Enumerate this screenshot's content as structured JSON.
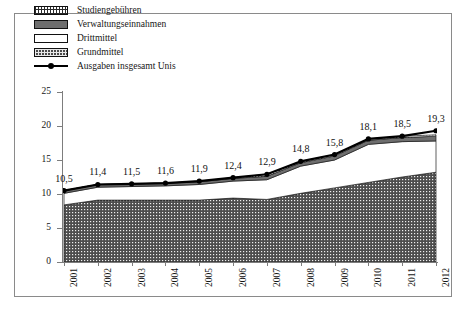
{
  "chart_data": {
    "type": "area",
    "title": "",
    "subtitle": "",
    "xlabel": "",
    "ylabel": "",
    "grid": false,
    "legend_position": "top-left",
    "ylim": [
      0,
      25
    ],
    "yticks": [
      0,
      5,
      10,
      15,
      20,
      25
    ],
    "ytick_labels": [
      "0",
      "5",
      "10",
      "15",
      "20",
      "25"
    ],
    "categories": [
      "2001",
      "2002",
      "2003",
      "2004",
      "2005",
      "2006",
      "2007",
      "2008",
      "2009",
      "2010",
      "2011",
      "2012"
    ],
    "stacked": true,
    "series": [
      {
        "name": "Grundmittel",
        "fill": "dotted-dark",
        "values": [
          8.4,
          9.1,
          9.1,
          9.1,
          9.1,
          9.4,
          9.2,
          10.1,
          10.9,
          11.7,
          12.5,
          13.2
        ]
      },
      {
        "name": "Drittmittel",
        "fill": "white",
        "values": [
          1.7,
          1.9,
          2.0,
          2.1,
          2.3,
          2.5,
          2.9,
          4.0,
          4.1,
          5.6,
          5.2,
          4.6
        ]
      },
      {
        "name": "Verwaltungseinnahmen",
        "fill": "solid-gray",
        "values": [
          0.4,
          0.4,
          0.4,
          0.4,
          0.4,
          0.4,
          0.5,
          0.5,
          0.6,
          0.6,
          0.6,
          0.7
        ]
      },
      {
        "name": "Studiengebühren",
        "fill": "hatched-white",
        "values": [
          0.0,
          0.0,
          0.0,
          0.0,
          0.1,
          0.1,
          0.3,
          0.2,
          0.2,
          0.2,
          0.2,
          0.2
        ]
      }
    ],
    "line_series": {
      "name": "Ausgaben insgesamt Unis",
      "marker": "filled-circle",
      "color": "#000000",
      "values": [
        10.5,
        11.4,
        11.5,
        11.6,
        11.9,
        12.4,
        12.9,
        14.8,
        15.8,
        18.1,
        18.5,
        19.3
      ],
      "data_labels": [
        "10,5",
        "11,4",
        "11,5",
        "11,6",
        "11,9",
        "12,4",
        "12,9",
        "14,8",
        "15,8",
        "18,1",
        "18,5",
        "19,3"
      ]
    },
    "legend_entries": [
      {
        "label": "Studiengebühren",
        "swatch": "hatched-white"
      },
      {
        "label": "Verwaltungseinnahmen",
        "swatch": "solid-gray"
      },
      {
        "label": "Drittmittel",
        "swatch": "white"
      },
      {
        "label": "Grundmittel",
        "swatch": "dotted-dark"
      },
      {
        "label": "Ausgaben insgesamt Unis",
        "swatch": "line-marker"
      }
    ],
    "colors": {
      "line": "#000000",
      "verwaltungseinnahmen": "#6e6e6e",
      "grundmittel": "#4a4a4a",
      "drittmittel": "#ffffff",
      "axis": "#7d7d7d",
      "frame": "#8a8a8a",
      "text": "#161616"
    }
  }
}
